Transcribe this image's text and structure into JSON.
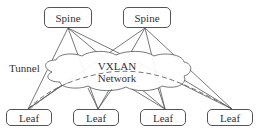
{
  "diagram": {
    "spines": [
      {
        "label": "Spine"
      },
      {
        "label": "Spine"
      }
    ],
    "leaves": [
      {
        "label": "Leaf"
      },
      {
        "label": "Leaf"
      },
      {
        "label": "Leaf"
      },
      {
        "label": "Leaf"
      }
    ],
    "cloud": {
      "line1": "VXLAN",
      "line2": "Network"
    },
    "tunnel_label": "Tunnel",
    "colors": {
      "line": "#555555",
      "dashed": "#666666",
      "border": "#555555",
      "text": "#333333"
    }
  }
}
